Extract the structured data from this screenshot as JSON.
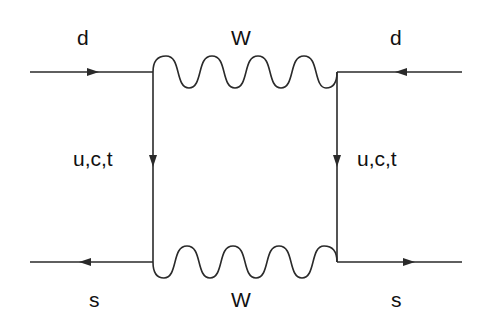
{
  "diagram": {
    "type": "feynman-box-diagram",
    "line_color": "#2a2a2a",
    "text_color": "#111111",
    "labels": {
      "in_top_left": "d",
      "boson_top": "W",
      "in_top_right": "d",
      "internal_left": "u,c,t",
      "internal_right": "u,c,t",
      "out_bottom_left": "s",
      "boson_bottom": "W",
      "out_bottom_right": "s"
    },
    "nodes": [
      {
        "id": "v1",
        "x": 153,
        "y": 72
      },
      {
        "id": "v2",
        "x": 337,
        "y": 72
      },
      {
        "id": "v3",
        "x": 153,
        "y": 262
      },
      {
        "id": "v4",
        "x": 337,
        "y": 262
      }
    ],
    "edges": [
      {
        "from": "ext-top-left",
        "to": "v1",
        "type": "fermion",
        "label": "d",
        "arrow": "right"
      },
      {
        "from": "ext-top-right",
        "to": "v2",
        "type": "fermion",
        "label": "d",
        "arrow": "left"
      },
      {
        "from": "v1",
        "to": "v2",
        "type": "boson-wavy",
        "label": "W"
      },
      {
        "from": "v1",
        "to": "v3",
        "type": "fermion",
        "label": "u,c,t",
        "arrow": "down"
      },
      {
        "from": "v2",
        "to": "v4",
        "type": "fermion",
        "label": "u,c,t",
        "arrow": "down"
      },
      {
        "from": "v3",
        "to": "v4",
        "type": "boson-wavy",
        "label": "W"
      },
      {
        "from": "v3",
        "to": "ext-bottom-left",
        "type": "fermion",
        "label": "s",
        "arrow": "left"
      },
      {
        "from": "v4",
        "to": "ext-bottom-right",
        "type": "fermion",
        "label": "s",
        "arrow": "right"
      }
    ]
  }
}
